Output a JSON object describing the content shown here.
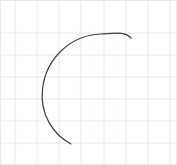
{
  "canvas": {
    "width": 177,
    "height": 165,
    "background_color": "#ffffff",
    "border_color": "#e8e8e8"
  },
  "grid": {
    "visible": true,
    "line_color": "#e3e9f0",
    "line_width": 1,
    "cell_size": 22,
    "vertical_lines_x": [
      14,
      36,
      58,
      80,
      103,
      125,
      147,
      169
    ],
    "horizontal_lines_y": [
      32,
      54,
      76,
      98,
      120,
      142
    ]
  },
  "chart_data": {
    "type": "line",
    "title": "",
    "subtitle": "",
    "xlabel": "",
    "ylabel": "",
    "xlim": [
      0,
      177
    ],
    "ylim": [
      0,
      165
    ],
    "grid": true,
    "legend": null,
    "annotations": [],
    "tick_labels_x": [],
    "tick_labels_y": [],
    "series": [
      {
        "name": "arc-stroke",
        "shape": "circular-arc",
        "stroke_color": "#3c3c3c",
        "stroke_width": 1.2,
        "fill": "none",
        "center_x": 96,
        "center_y": 88,
        "radius": 55,
        "start_angle_deg": -27,
        "end_angle_deg": 152,
        "direction": "counterclockwise",
        "start_point": [
          130,
          37
        ],
        "apex_point": [
          100,
          33
        ],
        "leftmost_point": [
          41,
          88
        ],
        "end_point": [
          70,
          143
        ],
        "path": "M 130 37 C 124 30 112 32.5 100 33 C 70 34 45 57 41.5 88 C 38.5 114 53 134 70 143"
      }
    ]
  }
}
